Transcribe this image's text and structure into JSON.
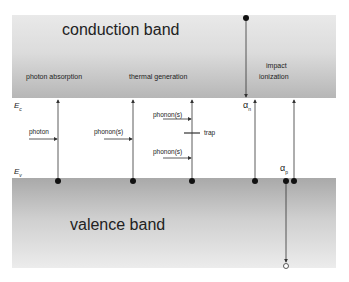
{
  "bands": {
    "conduction": "conduction band",
    "valence": "valence band"
  },
  "levels": {
    "ec": "E",
    "ec_sub": "c",
    "ev": "E",
    "ev_sub": "v"
  },
  "processes": {
    "photon_absorption": "photon absorption",
    "thermal_generation": "thermal generation",
    "impact_line1": "impact",
    "impact_line2": "ionization"
  },
  "arrows": {
    "photon": "photon",
    "phonons_1": "phonon(s)",
    "phonons_2": "phonon(s)",
    "phonons_3": "phonon(s)",
    "trap": "trap"
  },
  "coefficients": {
    "alpha_n": "α",
    "alpha_n_sub": "n",
    "alpha_p": "α",
    "alpha_p_sub": "p"
  },
  "colors": {
    "line": "#333333",
    "band_dark": "#a9a9a9",
    "band_light": "#ececec"
  }
}
